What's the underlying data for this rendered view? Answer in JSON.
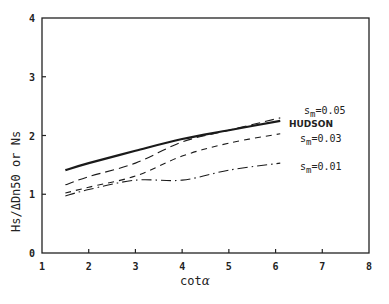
{
  "chart_data": {
    "type": "line",
    "title": "",
    "xlabel": "cot α",
    "ylabel": "Hs/ΔDn50 or Ns",
    "xlim": [
      1,
      8
    ],
    "ylim": [
      0,
      4
    ],
    "xticks": [
      1,
      2,
      3,
      4,
      5,
      6,
      7,
      8
    ],
    "yticks": [
      0,
      1,
      2,
      3,
      4
    ],
    "grid": false,
    "legend": "inline labels at right end of curves",
    "series": [
      {
        "name": "HUDSON",
        "style": "solid-thick",
        "x": [
          1.5,
          2,
          3,
          4,
          5,
          6.1
        ],
        "y": [
          1.41,
          1.53,
          1.74,
          1.94,
          2.09,
          2.25
        ]
      },
      {
        "name": "s_m=0.05",
        "style": "long-dash",
        "x": [
          1.5,
          2,
          3,
          4,
          5,
          6.1
        ],
        "y": [
          1.16,
          1.3,
          1.53,
          1.89,
          2.09,
          2.3
        ]
      },
      {
        "name": "s_m=0.03",
        "style": "short-dash",
        "x": [
          1.5,
          2,
          3,
          4,
          5,
          6.1
        ],
        "y": [
          1.02,
          1.12,
          1.31,
          1.65,
          1.87,
          2.03
        ]
      },
      {
        "name": "s_m=0.01",
        "style": "dash-dot",
        "x": [
          1.5,
          2,
          3,
          4,
          5,
          6.1
        ],
        "y": [
          0.97,
          1.08,
          1.24,
          1.24,
          1.41,
          1.53
        ]
      }
    ]
  },
  "labels": {
    "xlabel_main": "cot",
    "xlabel_greek": "α",
    "ylabel": "Hs/ΔDn50 or Ns",
    "hudson": "HUDSON",
    "sm005_prefix": "s",
    "sm005_sub": "m",
    "sm005_val": "=0.05",
    "sm003_prefix": "s",
    "sm003_sub": "m",
    "sm003_val": "=0.03",
    "sm001_prefix": "s",
    "sm001_sub": "m",
    "sm001_val": "=0.01",
    "xtick_labels": [
      "1",
      "2",
      "3",
      "4",
      "5",
      "6",
      "7",
      "8"
    ],
    "ytick_labels": [
      "0",
      "1",
      "2",
      "3",
      "4"
    ]
  }
}
